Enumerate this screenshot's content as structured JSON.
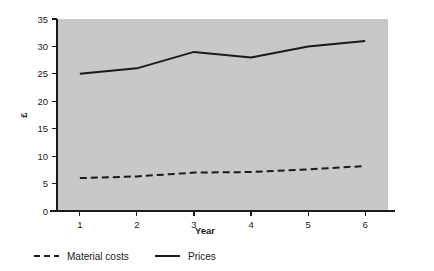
{
  "chart_data": {
    "type": "line",
    "title": "",
    "xlabel": "Year",
    "ylabel": "£",
    "x": [
      1,
      2,
      3,
      4,
      5,
      6
    ],
    "xticklabels": [
      "1",
      "2",
      "3",
      "4",
      "5",
      "6"
    ],
    "xlim": [
      0.6,
      6.4
    ],
    "ylim": [
      0,
      35
    ],
    "yticks": [
      0,
      5,
      10,
      15,
      20,
      25,
      30,
      35
    ],
    "yticklabels": [
      "0",
      "5",
      "10",
      "15",
      "20",
      "25",
      "30",
      "35"
    ],
    "grid": false,
    "legend_position": "below-axis",
    "plot_background_color": "#c8c8c8",
    "figure_background_color": "#ffffff",
    "series": [
      {
        "name": "Material costs",
        "style": "dashed",
        "color": "#1a1a1a",
        "values": [
          6,
          6.3,
          7,
          7.1,
          7.6,
          8.2
        ]
      },
      {
        "name": "Prices",
        "style": "solid",
        "color": "#1a1a1a",
        "values": [
          25,
          26,
          29,
          28,
          30,
          31
        ]
      }
    ]
  },
  "legend": {
    "items": [
      {
        "label": "Material costs",
        "style": "dashed"
      },
      {
        "label": "Prices",
        "style": "solid"
      }
    ]
  }
}
